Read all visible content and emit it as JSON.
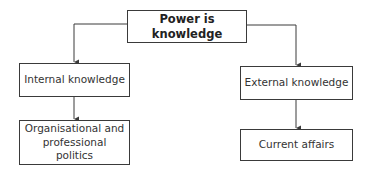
{
  "diagram": {
    "root": {
      "label": "Power is knowledge"
    },
    "branches": [
      {
        "label": "Internal knowledge",
        "child": {
          "label": "Organisational and professional politics"
        }
      },
      {
        "label": "External knowledge",
        "child": {
          "label": "Current affairs"
        }
      }
    ],
    "colors": {
      "line": "#3a3a3a",
      "background": "#ffffff",
      "text": "#222222"
    }
  }
}
